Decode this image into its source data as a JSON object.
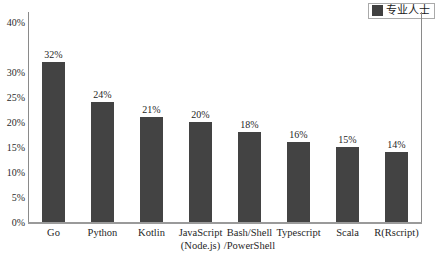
{
  "chart_data": {
    "type": "bar",
    "title": "",
    "xlabel": "",
    "ylabel": "",
    "ylim": [
      0,
      40
    ],
    "grid": false,
    "legend_position": "top-right",
    "categories": [
      "Go",
      "Python",
      "Kotlin",
      "JavaScript (Node.js)",
      "Bash/Shell /PowerShell",
      "Typescript",
      "Scala",
      "R(Rscript)"
    ],
    "category_lines": [
      [
        "Go",
        ""
      ],
      [
        "Python",
        ""
      ],
      [
        "Kotlin",
        ""
      ],
      [
        "JavaScript",
        "(Node.js)"
      ],
      [
        "Bash/Shell",
        "/PowerShell"
      ],
      [
        "Typescript",
        ""
      ],
      [
        "Scala",
        ""
      ],
      [
        "R(Rscript)",
        ""
      ]
    ],
    "series": [
      {
        "name": "专业人士",
        "values": [
          32,
          24,
          21,
          20,
          18,
          16,
          15,
          14
        ],
        "value_labels": [
          "32%",
          "24%",
          "21%",
          "20%",
          "18%",
          "16%",
          "15%",
          "14%"
        ],
        "color": "#434343"
      }
    ],
    "y_ticks": [
      {
        "value": 40,
        "label": "40%"
      },
      {
        "value": 30,
        "label": "30%"
      },
      {
        "value": 25,
        "label": "25%"
      },
      {
        "value": 20,
        "label": "20%"
      },
      {
        "value": 15,
        "label": "15%"
      },
      {
        "value": 10,
        "label": "10%"
      },
      {
        "value": 5,
        "label": "5%"
      },
      {
        "value": 0,
        "label": "0%"
      }
    ]
  },
  "legend": {
    "label": "专业人士",
    "swatch_color": "#404040"
  },
  "colors": {
    "bar": "#434343",
    "axis": "#8a8a8a",
    "text": "#1f1f1f",
    "background": "#ffffff"
  }
}
